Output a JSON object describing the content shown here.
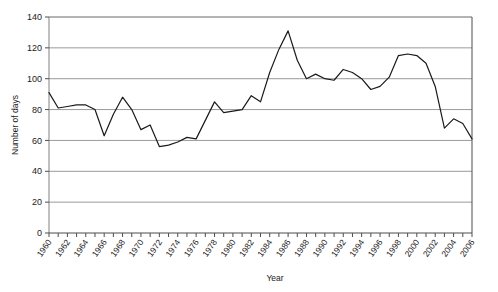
{
  "chart_data": {
    "type": "line",
    "title": "",
    "xlabel": "Year",
    "ylabel": "Number of days",
    "xlim": [
      1960,
      2006
    ],
    "ylim": [
      0,
      140
    ],
    "ytick_step": 20,
    "yticks": [
      0,
      20,
      40,
      60,
      80,
      100,
      120,
      140
    ],
    "xticks": [
      1960,
      1962,
      1964,
      1966,
      1968,
      1970,
      1972,
      1974,
      1976,
      1978,
      1980,
      1982,
      1984,
      1986,
      1988,
      1990,
      1992,
      1994,
      1996,
      1998,
      2000,
      2002,
      2004,
      2006
    ],
    "xtick_labels": [
      "1960",
      "1962",
      "1964",
      "1966",
      "1968",
      "1970",
      "1972",
      "1974",
      "1976",
      "1978",
      "1980",
      "1982",
      "1984",
      "1986",
      "1988",
      "1990",
      "1992",
      "1994",
      "1996",
      "1998",
      "2000",
      "2002",
      "2004",
      "2006"
    ],
    "grid": "horizontal",
    "legend": "none",
    "line_color": "#1a1a1a",
    "line_width": 1.2,
    "x": [
      1960,
      1961,
      1962,
      1963,
      1964,
      1965,
      1966,
      1967,
      1968,
      1969,
      1970,
      1971,
      1972,
      1973,
      1974,
      1975,
      1976,
      1977,
      1978,
      1979,
      1980,
      1981,
      1982,
      1983,
      1984,
      1985,
      1986,
      1987,
      1988,
      1989,
      1990,
      1991,
      1992,
      1993,
      1994,
      1995,
      1996,
      1997,
      1998,
      1999,
      2000,
      2001,
      2002,
      2003,
      2004,
      2005,
      2006
    ],
    "series": [
      {
        "name": "Number of days",
        "values": [
          91,
          81,
          82,
          83,
          83,
          80,
          63,
          77,
          88,
          80,
          67,
          70,
          56,
          57,
          59,
          62,
          61,
          73,
          85,
          78,
          79,
          80,
          89,
          85,
          104,
          119,
          131,
          112,
          100,
          103,
          100,
          99,
          106,
          104,
          100,
          93,
          95,
          101,
          115,
          116,
          115,
          110,
          95,
          68,
          74,
          71,
          61
        ]
      }
    ]
  },
  "axis": {
    "ylabel": "Number of days",
    "xlabel": "Year"
  }
}
